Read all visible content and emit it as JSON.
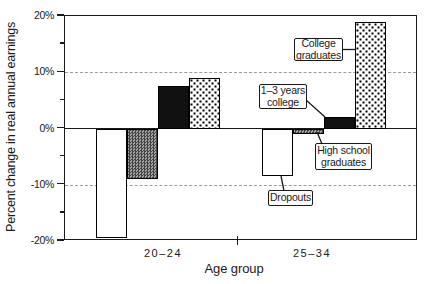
{
  "chart_data": {
    "type": "bar",
    "title": "",
    "xlabel": "Age group",
    "ylabel": "Percent change in real annual earnings",
    "ylim": [
      -20,
      20
    ],
    "ytick_values": [
      20,
      10,
      0,
      -10,
      -20
    ],
    "ytick_labels": [
      "20%",
      "10%",
      "0%",
      "-10%",
      "-20%"
    ],
    "minor_ytick_values": [
      15,
      5,
      -5,
      -15
    ],
    "dashed_gridlines": [
      10,
      -10
    ],
    "grid": "dashed horizontal at +10% and -10%, solid line at 0%",
    "legend_position": "none (direct callout labels)",
    "categories": [
      "20–24",
      "25–34"
    ],
    "series": [
      {
        "id": "dropouts",
        "name": "Dropouts",
        "pattern": "white",
        "values": [
          -19.5,
          -8.5
        ]
      },
      {
        "id": "high-school-graduates",
        "name": "High school graduates",
        "pattern": "checker-gray",
        "values": [
          -9,
          -1
        ]
      },
      {
        "id": "1-3-years-college",
        "name": "1–3 years college",
        "pattern": "solid-black",
        "values": [
          7.5,
          2
        ]
      },
      {
        "id": "college-graduates",
        "name": "College graduates",
        "pattern": "dotted",
        "values": [
          9,
          19
        ]
      }
    ],
    "annotations": [
      {
        "id": "college-graduates",
        "line1": "College",
        "line2": "graduates"
      },
      {
        "id": "1-3-years-college",
        "line1": "1–3 years",
        "line2": "college"
      },
      {
        "id": "high-school-graduates",
        "line1": "High school",
        "line2": "graduates"
      },
      {
        "id": "dropouts",
        "line1": "Dropouts"
      }
    ],
    "colors": {
      "axis": "#1a1a1a",
      "gridline": "#9a9a9a",
      "solid_bar": "#111111",
      "background": "#ffffff"
    }
  }
}
